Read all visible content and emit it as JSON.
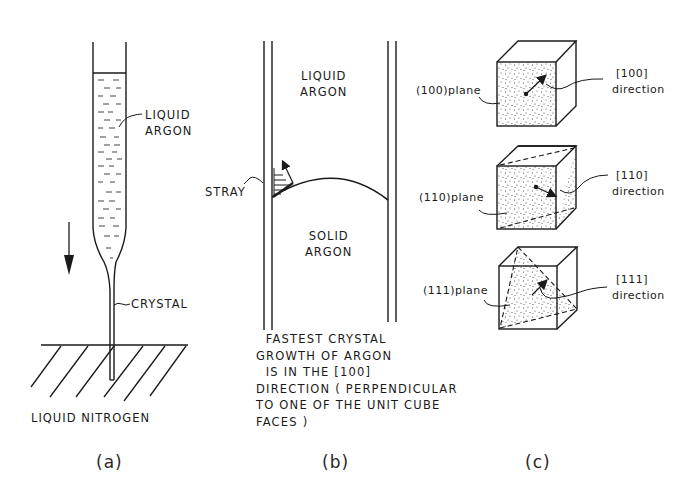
{
  "figure": {
    "panel_a": {
      "caption": "(a)",
      "labels": {
        "liquid_line1": "LIQUID",
        "liquid_line2": "ARGON",
        "crystal": "CRYSTAL",
        "nitrogen": "LIQUID NITROGEN"
      },
      "arrow": "down-arrow"
    },
    "panel_b": {
      "caption": "(b)",
      "labels": {
        "liquid_line1": "LIQUID",
        "liquid_line2": "ARGON",
        "solid_line1": "SOLID",
        "solid_line2": "ARGON",
        "stray": "STRAY"
      },
      "description": [
        "  FASTEST CRYSTAL",
        "GROWTH OF ARGON",
        "  IS IN THE [100]",
        "DIRECTION ( PERPENDICULAR",
        "TO ONE OF THE UNIT CUBE",
        "FACES )"
      ]
    },
    "panel_c": {
      "caption": "(c)",
      "cubes": [
        {
          "plane": "(100)plane",
          "direction_index": "[100]",
          "direction_word": "direction"
        },
        {
          "plane": "(110)plane",
          "direction_index": "[110]",
          "direction_word": "direction"
        },
        {
          "plane": "(111)plane",
          "direction_index": "[111]",
          "direction_word": "direction"
        }
      ]
    }
  }
}
